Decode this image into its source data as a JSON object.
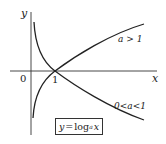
{
  "diagram": {
    "axes": {
      "x_label": "x",
      "y_label": "y",
      "origin_label": "0",
      "tick_label": "1"
    },
    "curves": [
      {
        "name": "increasing",
        "label": "a > 1"
      },
      {
        "name": "decreasing",
        "label": "0<a<1"
      }
    ],
    "formula": {
      "lhs": "y",
      "eq": "=",
      "func": "log",
      "base": "a",
      "arg": "x"
    },
    "colors": {
      "stroke": "#222222",
      "background": "#ffffff"
    }
  }
}
